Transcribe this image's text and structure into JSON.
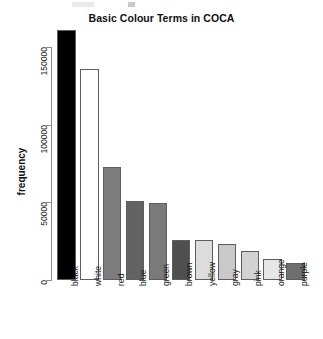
{
  "chart_data": {
    "type": "bar",
    "title": "Basic Colour Terms in COCA",
    "xlabel": "",
    "ylabel": "frequency",
    "categories": [
      "black",
      "white",
      "red",
      "blue",
      "green",
      "brown",
      "yellow",
      "gray",
      "pink",
      "orange",
      "purple"
    ],
    "values": [
      161000,
      136000,
      73000,
      51000,
      49500,
      26000,
      26000,
      23000,
      19000,
      13500,
      11000
    ],
    "bar_colors": [
      "#000000",
      "#ffffff",
      "#7d7d7d",
      "#636363",
      "#7a7a7a",
      "#4f4f4f",
      "#dcdcdc",
      "#c9c9c9",
      "#d2d2d2",
      "#e6e6e6",
      "#6e6e6e"
    ],
    "ylim": [
      0,
      165000
    ],
    "yticks": [
      0,
      50000,
      100000,
      150000
    ],
    "ytick_labels": [
      "0",
      "50000",
      "100000",
      "150000"
    ],
    "grid": false,
    "legend": false
  },
  "axis": {
    "y_title": "frequency",
    "bar_outline_color": "#5e5e5e",
    "axis_color": "#8c8c8c"
  }
}
